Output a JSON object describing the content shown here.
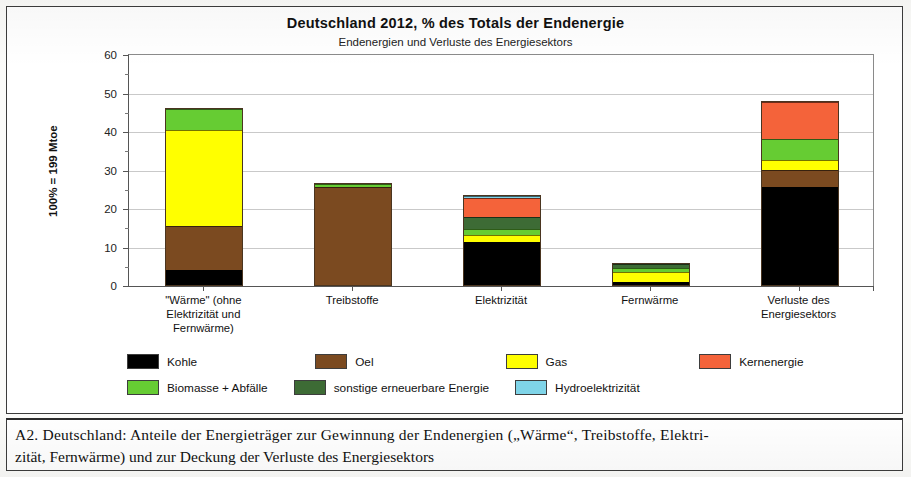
{
  "figure": {
    "title": "Deutschland  2012, % des Totals der Endenergie",
    "subtitle": "Endenergien und Verluste des Energiesektors",
    "yaxis_title": "100% = 199 Mtoe"
  },
  "caption": {
    "line1": "A2.  Deutschland:   Anteile der Energieträger zur Gewinnung der Endenergien („Wärme“, Treibstoffe, Elektri-",
    "line2": "zität, Fernwärme) und zur Deckung der Verluste des Energiesektors"
  },
  "legend": {
    "row1": [
      {
        "label": "Kohle",
        "color": "#000000"
      },
      {
        "label": "Oel",
        "color": "#7b4a20"
      },
      {
        "label": "Gas",
        "color": "#ffff00"
      },
      {
        "label": "Kernenergie",
        "color": "#f4633a"
      }
    ],
    "row2": [
      {
        "label": "Biomasse + Abfälle",
        "color": "#66cc33"
      },
      {
        "label": "sonstige erneuerbare Energie",
        "color": "#3d6b35"
      },
      {
        "label": "Hydroelektrizität",
        "color": "#7fd4e8"
      }
    ]
  },
  "chart_data": {
    "type": "bar",
    "subtype": "stacked",
    "title": "Deutschland  2012, % des Totals der Endenergie",
    "subtitle": "Endenergien und Verluste des Energiesektors",
    "xlabel": "",
    "ylabel": "100% = 199 Mtoe",
    "ylim": [
      0,
      60
    ],
    "yticks": [
      0,
      10,
      20,
      30,
      40,
      50,
      60
    ],
    "yminorticks": [
      5,
      15,
      25,
      35,
      45,
      55
    ],
    "grid": "horizontal",
    "legend_position": "below-plot",
    "units": "% des Totals der Endenergie (100% = 199 Mtoe)",
    "categories": [
      "\"Wärme\" (ohne\nElektrizität und\nFernwärme)",
      "Treibstoffe",
      "Elektrizität",
      "Fernwärme",
      "Verluste des\nEnergiesektors"
    ],
    "category_lines": [
      [
        "\"Wärme\" (ohne",
        "Elektrizität und",
        "Fernwärme)"
      ],
      [
        "Treibstoffe"
      ],
      [
        "Elektrizität"
      ],
      [
        "Fernwärme"
      ],
      [
        "Verluste des",
        "Energiesektors"
      ]
    ],
    "series": [
      {
        "name": "Kohle",
        "color": "#000000",
        "values": [
          4.0,
          0.0,
          11.2,
          0.8,
          25.5
        ]
      },
      {
        "name": "Oel",
        "color": "#7b4a20",
        "values": [
          11.3,
          25.5,
          0.0,
          0.0,
          4.5
        ]
      },
      {
        "name": "Gas",
        "color": "#ffff00",
        "values": [
          25.0,
          0.0,
          1.9,
          2.6,
          2.5
        ]
      },
      {
        "name": "Biomasse + Abfälle",
        "color": "#66cc33",
        "values": [
          5.5,
          0.8,
          1.5,
          1.0,
          5.5
        ]
      },
      {
        "name": "sonstige erneuerbare Energie",
        "color": "#3d6b35",
        "values": [
          0.0,
          0.0,
          3.0,
          1.1,
          0.0
        ]
      },
      {
        "name": "Kernenergie",
        "color": "#f4633a",
        "values": [
          0.0,
          0.0,
          4.9,
          0.0,
          9.5
        ]
      },
      {
        "name": "Hydroelektrizität",
        "color": "#7fd4e8",
        "values": [
          0.0,
          0.0,
          0.6,
          0.0,
          0.0
        ]
      }
    ],
    "totals": [
      45.8,
      26.3,
      23.1,
      5.5,
      47.5
    ]
  }
}
